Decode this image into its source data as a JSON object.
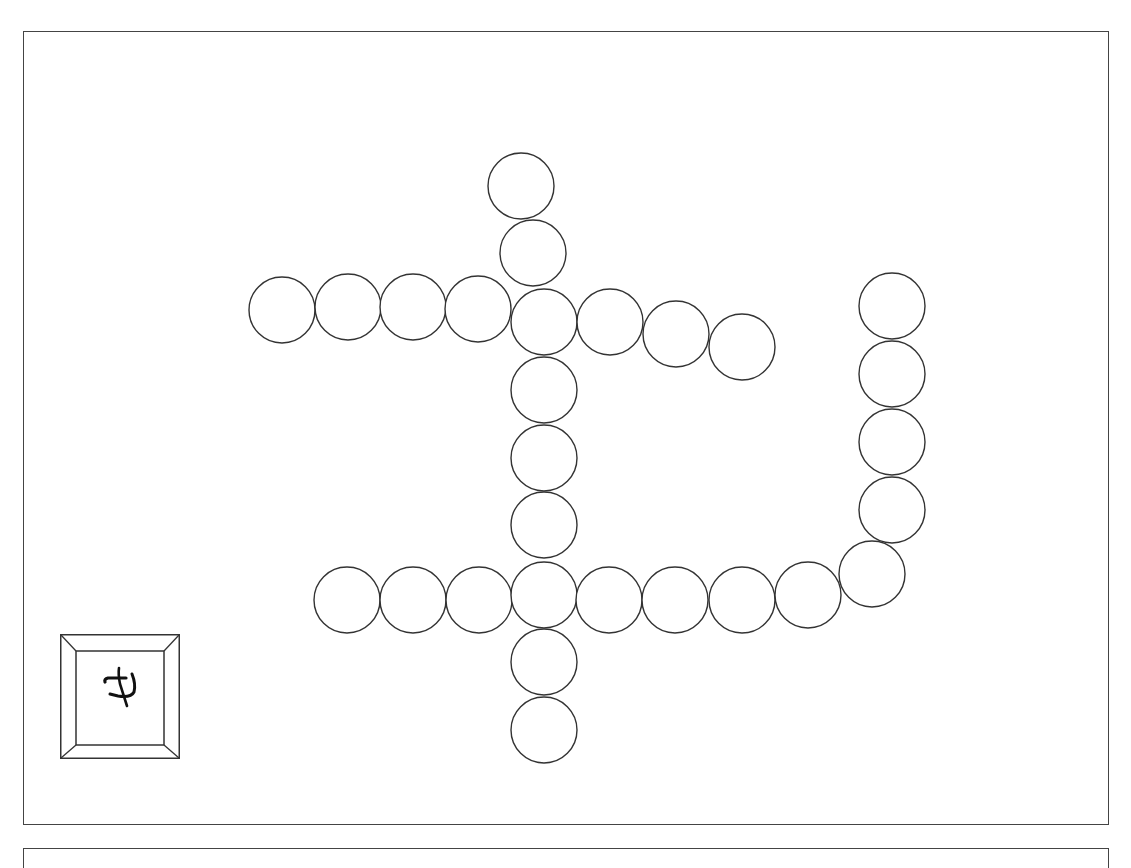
{
  "game": {
    "type": "circle-chain-board",
    "colors": {
      "stroke": "#333333",
      "fill": "#ffffff",
      "border": "#444444",
      "background": "#ffffff"
    },
    "circle_radius": 33,
    "slots": [
      {
        "id": "top-1",
        "cx": 521,
        "cy": 186,
        "branch": "vertical-upper"
      },
      {
        "id": "top-2",
        "cx": 533,
        "cy": 253,
        "branch": "vertical-upper"
      },
      {
        "id": "row1-1",
        "cx": 282,
        "cy": 310,
        "branch": "row-upper-left"
      },
      {
        "id": "row1-2",
        "cx": 348,
        "cy": 307,
        "branch": "row-upper-left"
      },
      {
        "id": "row1-3",
        "cx": 413,
        "cy": 307,
        "branch": "row-upper-left"
      },
      {
        "id": "row1-4",
        "cx": 478,
        "cy": 309,
        "branch": "row-upper-left"
      },
      {
        "id": "hub-upper",
        "cx": 544,
        "cy": 322,
        "branch": "hub"
      },
      {
        "id": "row1-6",
        "cx": 610,
        "cy": 322,
        "branch": "row-upper-right"
      },
      {
        "id": "row1-7",
        "cx": 676,
        "cy": 334,
        "branch": "row-upper-right"
      },
      {
        "id": "row1-8",
        "cx": 742,
        "cy": 347,
        "branch": "row-upper-right"
      },
      {
        "id": "col-1",
        "cx": 544,
        "cy": 390,
        "branch": "vertical-middle"
      },
      {
        "id": "col-2",
        "cx": 544,
        "cy": 458,
        "branch": "vertical-middle"
      },
      {
        "id": "col-3",
        "cx": 544,
        "cy": 525,
        "branch": "vertical-middle"
      },
      {
        "id": "row2-1",
        "cx": 347,
        "cy": 600,
        "branch": "row-lower-left"
      },
      {
        "id": "row2-2",
        "cx": 413,
        "cy": 600,
        "branch": "row-lower-left"
      },
      {
        "id": "row2-3",
        "cx": 479,
        "cy": 600,
        "branch": "row-lower-left"
      },
      {
        "id": "hub-lower",
        "cx": 544,
        "cy": 595,
        "branch": "hub"
      },
      {
        "id": "row2-5",
        "cx": 609,
        "cy": 600,
        "branch": "row-lower-right"
      },
      {
        "id": "row2-6",
        "cx": 675,
        "cy": 600,
        "branch": "row-lower-right"
      },
      {
        "id": "row2-7",
        "cx": 742,
        "cy": 600,
        "branch": "row-lower-right"
      },
      {
        "id": "row2-8",
        "cx": 808,
        "cy": 595,
        "branch": "row-lower-right"
      },
      {
        "id": "row2-9",
        "cx": 872,
        "cy": 574,
        "branch": "row-lower-right"
      },
      {
        "id": "right-1",
        "cx": 892,
        "cy": 306,
        "branch": "vertical-right"
      },
      {
        "id": "right-2",
        "cx": 892,
        "cy": 374,
        "branch": "vertical-right"
      },
      {
        "id": "right-3",
        "cx": 892,
        "cy": 442,
        "branch": "vertical-right"
      },
      {
        "id": "right-4",
        "cx": 892,
        "cy": 510,
        "branch": "vertical-right"
      },
      {
        "id": "bottom-1",
        "cx": 544,
        "cy": 662,
        "branch": "vertical-lower"
      },
      {
        "id": "bottom-2",
        "cx": 544,
        "cy": 730,
        "branch": "vertical-lower"
      }
    ],
    "tile": {
      "glyph": "ヰ",
      "glyph_description": "hand-drawn symbol (cross with hook)",
      "position": "bottom-left"
    }
  }
}
